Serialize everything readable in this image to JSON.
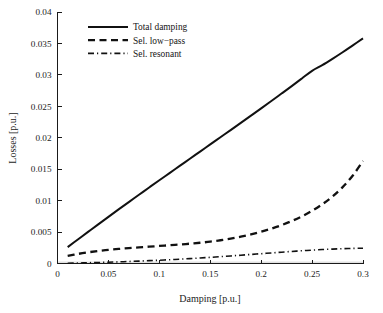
{
  "figure": {
    "background_color": "#ffffff",
    "ink_color": "#111111"
  },
  "axes": {
    "x_title": "Damping [p.u.]",
    "y_title": "Losses [p.u.]",
    "x_ticks": [
      "0",
      "0.05",
      "0.1",
      "0.15",
      "0.2",
      "0.25",
      "0.3"
    ],
    "y_ticks": [
      "0",
      "0.005",
      "0.01",
      "0.015",
      "0.02",
      "0.025",
      "0.03",
      "0.035",
      "0.04"
    ]
  },
  "legend": {
    "entries": [
      {
        "label": "Total damping",
        "style": "solid"
      },
      {
        "label": "Sel. low−pass",
        "style": "dashed"
      },
      {
        "label": "Sel. resonant",
        "style": "dashdot"
      }
    ]
  },
  "chart_data": {
    "type": "line",
    "title": "",
    "xlabel": "Damping [p.u.]",
    "ylabel": "Losses [p.u.]",
    "xlim": [
      0,
      0.3
    ],
    "ylim": [
      0,
      0.04
    ],
    "xticks": [
      0,
      0.05,
      0.1,
      0.15,
      0.2,
      0.25,
      0.3
    ],
    "yticks": [
      0,
      0.005,
      0.01,
      0.015,
      0.02,
      0.025,
      0.03,
      0.035,
      0.04
    ],
    "grid": false,
    "legend_position": "upper left",
    "x": [
      0.01,
      0.02,
      0.03,
      0.04,
      0.05,
      0.06,
      0.07,
      0.08,
      0.09,
      0.1,
      0.11,
      0.12,
      0.13,
      0.14,
      0.15,
      0.16,
      0.17,
      0.18,
      0.19,
      0.2,
      0.21,
      0.22,
      0.23,
      0.24,
      0.25,
      0.26,
      0.27,
      0.28,
      0.29,
      0.3
    ],
    "series": [
      {
        "name": "Total damping",
        "style": "solid",
        "color": "#111111",
        "values": [
          0.0026,
          0.00382,
          0.00503,
          0.00623,
          0.00742,
          0.0086,
          0.00977,
          0.01093,
          0.01209,
          0.01324,
          0.01438,
          0.01552,
          0.01666,
          0.0178,
          0.01894,
          0.02008,
          0.02122,
          0.02237,
          0.02352,
          0.02468,
          0.02585,
          0.02703,
          0.02822,
          0.02943,
          0.03065,
          0.03155,
          0.03255,
          0.0336,
          0.0347,
          0.0358
        ]
      },
      {
        "name": "Sel. low−pass",
        "style": "dashed",
        "color": "#111111",
        "values": [
          0.0012,
          0.00152,
          0.00178,
          0.00199,
          0.00217,
          0.00232,
          0.00245,
          0.00257,
          0.00268,
          0.00279,
          0.0029,
          0.00302,
          0.00315,
          0.0033,
          0.00348,
          0.0037,
          0.00396,
          0.00427,
          0.00463,
          0.00505,
          0.00554,
          0.0061,
          0.00675,
          0.0075,
          0.00838,
          0.00942,
          0.01065,
          0.01215,
          0.014,
          0.0163
        ]
      },
      {
        "name": "Sel. resonant",
        "style": "dashdot",
        "color": "#111111",
        "values": [
          5e-05,
          8e-05,
          0.00012,
          0.00016,
          0.00021,
          0.00026,
          0.00032,
          0.00038,
          0.00045,
          0.00052,
          0.0006,
          0.00069,
          0.00078,
          0.00088,
          0.00098,
          0.00109,
          0.0012,
          0.00132,
          0.00144,
          0.00156,
          0.00168,
          0.0018,
          0.00192,
          0.00203,
          0.00213,
          0.00222,
          0.00229,
          0.00235,
          0.0024,
          0.00243
        ]
      }
    ]
  }
}
